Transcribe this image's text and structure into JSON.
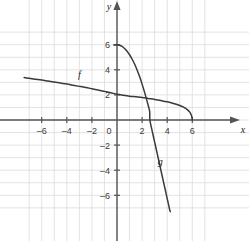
{
  "chart_data": {
    "type": "line",
    "title": "",
    "xlabel": "x",
    "ylabel": "y",
    "xlim": [
      -7.4,
      7.2
    ],
    "ylim": [
      -7.2,
      7.3
    ],
    "grid": true,
    "grid_step": 1,
    "legend": "inline-curve-labels",
    "x_ticks": [
      -6,
      -4,
      -2,
      0,
      2,
      4,
      6
    ],
    "x_tick_labels": [
      "–6",
      "–4",
      "–2",
      "0",
      "2",
      "4",
      "6"
    ],
    "y_ticks": [
      6,
      4,
      2,
      -2,
      -4,
      -6
    ],
    "y_tick_labels": [
      "6",
      "4",
      "2",
      "–2",
      "–4",
      "–6"
    ],
    "origin_label": "0",
    "series": [
      {
        "name": "f",
        "label": "f",
        "label_x": -3.0,
        "label_y": 3.35,
        "description": "decreasing concave-down curve crossing y-axis near 2.5 and reaching zero at x = 6",
        "points": [
          [
            -7.4,
            3.38
          ],
          [
            -7.0,
            3.32
          ],
          [
            -6.5,
            3.25
          ],
          [
            -6.0,
            3.18
          ],
          [
            -5.5,
            3.1
          ],
          [
            -5.0,
            3.02
          ],
          [
            -4.5,
            2.94
          ],
          [
            -4.0,
            2.86
          ],
          [
            -3.5,
            2.77
          ],
          [
            -3.0,
            2.68
          ],
          [
            -2.5,
            2.59
          ],
          [
            -2.0,
            2.49
          ],
          [
            -1.5,
            2.39
          ],
          [
            -1.0,
            2.28
          ],
          [
            -0.5,
            2.17
          ],
          [
            0.0,
            2.05
          ],
          [
            0.5,
            1.97
          ],
          [
            1.0,
            1.9
          ],
          [
            1.5,
            1.85
          ],
          [
            2.0,
            1.8
          ],
          [
            2.5,
            1.72
          ],
          [
            3.0,
            1.64
          ],
          [
            3.5,
            1.55
          ],
          [
            4.0,
            1.45
          ],
          [
            4.5,
            1.32
          ],
          [
            5.0,
            1.16
          ],
          [
            5.3,
            1.02
          ],
          [
            5.6,
            0.83
          ],
          [
            5.8,
            0.63
          ],
          [
            5.92,
            0.4
          ],
          [
            5.98,
            0.18
          ],
          [
            6.0,
            0.0
          ]
        ]
      },
      {
        "name": "g",
        "label": "g",
        "label_x": 3.45,
        "label_y": -3.6,
        "description": "curve with flat maximum at (0, 6) falling steeply and exiting the bottom of the grid",
        "points": [
          [
            -0.25,
            5.97
          ],
          [
            0.0,
            6.0
          ],
          [
            0.2,
            5.96
          ],
          [
            0.4,
            5.86
          ],
          [
            0.6,
            5.7
          ],
          [
            0.8,
            5.48
          ],
          [
            1.0,
            5.2
          ],
          [
            1.2,
            4.86
          ],
          [
            1.4,
            4.46
          ],
          [
            1.6,
            3.99
          ],
          [
            1.8,
            3.46
          ],
          [
            2.0,
            2.86
          ],
          [
            2.2,
            2.2
          ],
          [
            2.4,
            1.48
          ],
          [
            2.6,
            0.7
          ],
          [
            2.62,
            0.0
          ],
          [
            2.8,
            -0.86
          ],
          [
            3.0,
            -1.76
          ],
          [
            3.2,
            -2.66
          ],
          [
            3.4,
            -3.56
          ],
          [
            3.6,
            -4.46
          ],
          [
            3.8,
            -5.36
          ],
          [
            4.0,
            -6.26
          ],
          [
            4.2,
            -7.16
          ],
          [
            4.25,
            -7.3
          ]
        ]
      }
    ],
    "intersection": [
      2.0,
      2.0
    ]
  }
}
